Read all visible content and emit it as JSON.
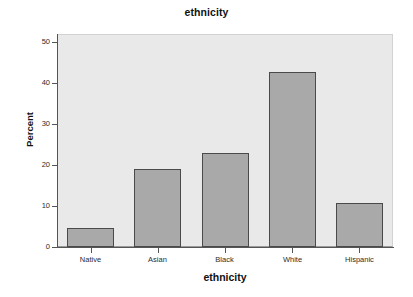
{
  "chart_data": {
    "type": "bar",
    "title": "ethnicity",
    "xlabel": "ethnicity",
    "ylabel": "Percent",
    "categories": [
      "Native",
      "Asian",
      "Black",
      "White",
      "Hispanic"
    ],
    "values": [
      4.7,
      19.0,
      22.9,
      42.8,
      10.7
    ],
    "ylim": [
      0,
      52
    ],
    "yticks": [
      0,
      10,
      20,
      30,
      40,
      50
    ],
    "ytick_labels": [
      "0",
      "10",
      "20",
      "30",
      "40",
      "50"
    ],
    "grid": false,
    "legend": null,
    "colors": {
      "bar_fill": "#a9a9a9",
      "bar_border": "#4a4a4a",
      "plot_background": "#e9e9e9",
      "figure_background": "#ffffff",
      "axis": "#555555",
      "text": "#111111"
    }
  }
}
